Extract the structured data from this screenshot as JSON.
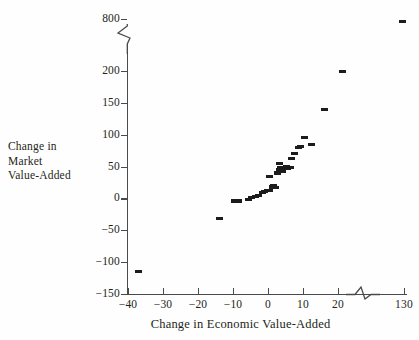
{
  "chart_data": {
    "type": "scatter",
    "title": "",
    "xlabel": "Change in Economic Value-Added",
    "ylabel": "Change in\nMarket\nValue-Added",
    "ylabel_lines": [
      "Change in",
      "Market",
      "Value-Added"
    ],
    "grid": false,
    "legend": "none",
    "marker": "filled-rectangle",
    "marker_color": "#1c1c1c",
    "axis_color": "#4a4a4a",
    "xlim": [
      -40,
      130
    ],
    "ylim": [
      -150,
      800
    ],
    "x_axis_break": {
      "after": 25,
      "before": 130,
      "note": "axis break notch between 25 and 130"
    },
    "y_axis_break": {
      "after": 200,
      "before": 800,
      "note": "axis break notch between 200 and 800"
    },
    "xticks": [
      -40,
      -30,
      -20,
      -10,
      0,
      10,
      20,
      130
    ],
    "xtick_labels": [
      "−40",
      "−30",
      "−20",
      "−10",
      "0",
      "10",
      "20",
      "130"
    ],
    "yticks": [
      -150,
      -100,
      -50,
      0,
      50,
      100,
      150,
      200,
      800
    ],
    "ytick_labels": [
      "−150",
      "−100",
      "−50",
      "0",
      "50",
      "100",
      "150",
      "200",
      "800"
    ],
    "points": [
      {
        "x": -37,
        "y": -115
      },
      {
        "x": -14,
        "y": -32
      },
      {
        "x": -9.5,
        "y": -4
      },
      {
        "x": -8.3,
        "y": -4
      },
      {
        "x": -5.5,
        "y": -1
      },
      {
        "x": -4.6,
        "y": 1
      },
      {
        "x": -3.6,
        "y": 3
      },
      {
        "x": -2.6,
        "y": 5
      },
      {
        "x": -1.7,
        "y": 9
      },
      {
        "x": -1.0,
        "y": 11
      },
      {
        "x": -0.3,
        "y": 12
      },
      {
        "x": 0.4,
        "y": 13
      },
      {
        "x": 0.5,
        "y": 34
      },
      {
        "x": 1.3,
        "y": 18
      },
      {
        "x": 1.6,
        "y": 20
      },
      {
        "x": 2.1,
        "y": 17
      },
      {
        "x": 2.6,
        "y": 40
      },
      {
        "x": 3.2,
        "y": 45
      },
      {
        "x": 3.4,
        "y": 55
      },
      {
        "x": 3.6,
        "y": 49
      },
      {
        "x": 4.0,
        "y": 43
      },
      {
        "x": 4.6,
        "y": 47
      },
      {
        "x": 5.2,
        "y": 50
      },
      {
        "x": 5.6,
        "y": 47
      },
      {
        "x": 6.3,
        "y": 48
      },
      {
        "x": 6.6,
        "y": 62
      },
      {
        "x": 7.6,
        "y": 70
      },
      {
        "x": 8.6,
        "y": 80
      },
      {
        "x": 9.2,
        "y": 82
      },
      {
        "x": 10.4,
        "y": 96
      },
      {
        "x": 12.4,
        "y": 84
      },
      {
        "x": 16.0,
        "y": 139
      },
      {
        "x": 21.3,
        "y": 199
      },
      {
        "x": 128.0,
        "y": 760
      }
    ]
  }
}
